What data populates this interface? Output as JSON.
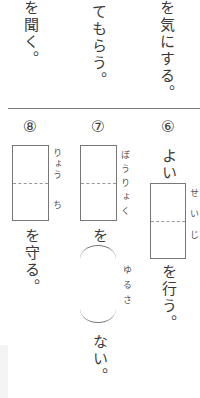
{
  "top_section": {
    "right_column": "を気にする。",
    "middle_column": "てもらう。",
    "left_column": "を聞く。"
  },
  "questions": [
    {
      "number": "⑥",
      "prefix": "よい",
      "furigana": "せいじ",
      "suffix": "を行う。"
    },
    {
      "number": "⑦",
      "furigana": "ぼうりょく",
      "particle": "を",
      "paren_furigana": "ゆるさ",
      "suffix": "ない。"
    },
    {
      "number": "⑧",
      "furigana_top": "りょう",
      "furigana_bottom": "ち",
      "suffix": "を守る。"
    }
  ]
}
